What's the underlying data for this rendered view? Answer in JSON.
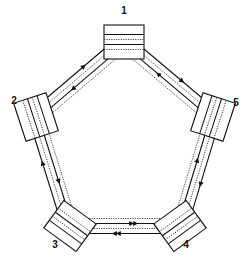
{
  "diagram": {
    "type": "dual-ring-topology",
    "nodes": [
      {
        "id": "1",
        "label": "1",
        "x": 124,
        "y": 42,
        "angle": 0,
        "label_x": 124,
        "label_y": 14
      },
      {
        "id": "2",
        "label": "2",
        "x": 36,
        "y": 117,
        "angle": 72,
        "label_x": 14,
        "label_y": 104
      },
      {
        "id": "3",
        "label": "3",
        "x": 70,
        "y": 226,
        "angle": 36,
        "label_x": 55,
        "label_y": 248
      },
      {
        "id": "4",
        "label": "4",
        "x": 180,
        "y": 226,
        "angle": -36,
        "label_x": 186,
        "label_y": 248
      },
      {
        "id": "5",
        "label": "5",
        "x": 213,
        "y": 117,
        "angle": -72,
        "label_x": 236,
        "label_y": 106
      }
    ],
    "links": [
      {
        "from": "1",
        "to": "2",
        "outer_arrow_toward": "1",
        "inner_arrow_toward": "2"
      },
      {
        "from": "1",
        "to": "5",
        "outer_arrow_toward": "5",
        "inner_arrow_toward": "1"
      },
      {
        "from": "2",
        "to": "3",
        "outer_arrow_toward": "2",
        "inner_arrow_toward": "3"
      },
      {
        "from": "5",
        "to": "4",
        "outer_arrow_toward": "4",
        "inner_arrow_toward": "5"
      },
      {
        "from": "3",
        "to": "4",
        "outer_arrow_toward": "3",
        "inner_arrow_toward": "4"
      }
    ],
    "outer_ring_direction": "clockwise",
    "inner_ring_direction": "counter-clockwise",
    "colors": {
      "line": "#111111",
      "background": "#ffffff"
    }
  }
}
